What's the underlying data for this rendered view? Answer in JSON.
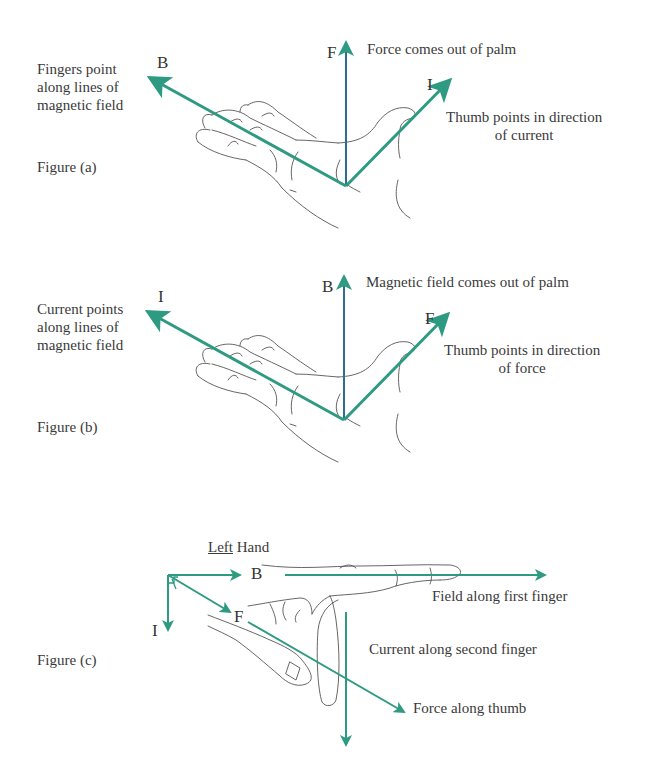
{
  "colors": {
    "arrow_green": "#2e9a82",
    "arrow_blue": "#2a6f8f",
    "text": "#3a3a3a",
    "hand_outline": "#555555"
  },
  "figure_a": {
    "caption": "Figure (a)",
    "vector_labels": {
      "B": "B",
      "F": "F",
      "I": "I"
    },
    "annotations": {
      "fingers": [
        "Fingers point",
        "along lines of",
        "magnetic field"
      ],
      "palm": "Force comes out of palm",
      "thumb": [
        "Thumb points in direction",
        "of current"
      ]
    }
  },
  "figure_b": {
    "caption": "Figure (b)",
    "vector_labels": {
      "I": "I",
      "B": "B",
      "F": "F"
    },
    "annotations": {
      "fingers": [
        "Current points",
        "along lines of",
        "magnetic field"
      ],
      "palm": "Magnetic field comes out of palm",
      "thumb": [
        "Thumb points in direction",
        "of force"
      ]
    }
  },
  "figure_c": {
    "caption": "Figure (c)",
    "title_underlined": "Left",
    "title_rest": "Hand",
    "vector_labels": {
      "B": "B",
      "I": "I",
      "F": "F"
    },
    "annotations": {
      "field": "Field along first finger",
      "current": "Current along second finger",
      "force": "Force along thumb"
    }
  }
}
